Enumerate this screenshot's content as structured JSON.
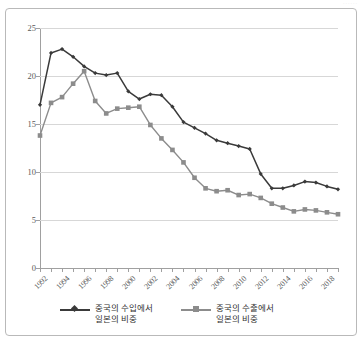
{
  "figure": {
    "scan_artifact_text": "······",
    "background_color": "#ffffff",
    "frame_color": "#b9b9b9"
  },
  "chart_data": {
    "type": "line",
    "title": "",
    "subtitle": "",
    "xlabel": "",
    "ylabel": "",
    "ylim": [
      0,
      25
    ],
    "yticks": [
      0,
      5,
      10,
      15,
      20,
      25
    ],
    "ytick_labels": [
      "0",
      "5",
      "10",
      "15",
      "20",
      "25"
    ],
    "grid": true,
    "grid_axis": "y",
    "legend_position": "bottom",
    "x": [
      1992,
      1993,
      1994,
      1995,
      1996,
      1997,
      1998,
      1999,
      2000,
      2001,
      2002,
      2003,
      2004,
      2005,
      2006,
      2007,
      2008,
      2009,
      2010,
      2011,
      2012,
      2013,
      2014,
      2015,
      2016,
      2017,
      2018,
      2019
    ],
    "xtick_labels": [
      "1992",
      "1994",
      "1996",
      "1998",
      "2000",
      "2002",
      "2004",
      "2006",
      "2008",
      "2010",
      "2012",
      "2014",
      "2016",
      "2018"
    ],
    "xtick_values": [
      1992,
      1994,
      1996,
      1998,
      2000,
      2002,
      2004,
      2006,
      2008,
      2010,
      2012,
      2014,
      2016,
      2018
    ],
    "series": [
      {
        "name": "중국의 수입에서 일본의 비중",
        "name_line1": "중국의 수입에서",
        "name_line2": "일본의 비중",
        "color": "#3a3a3a",
        "marker": "diamond",
        "values": [
          17.0,
          22.4,
          22.8,
          22.0,
          21.0,
          20.3,
          20.1,
          20.3,
          18.4,
          17.6,
          18.1,
          18.0,
          16.8,
          15.2,
          14.6,
          14.0,
          13.3,
          13.0,
          12.7,
          12.4,
          9.8,
          8.3,
          8.3,
          8.6,
          9.0,
          8.9,
          8.5,
          8.2
        ]
      },
      {
        "name": "중국의 수출에서 일본의 비중",
        "name_line1": "중국의 수출에서",
        "name_line2": "일본의 비중",
        "color": "#8c8c8c",
        "marker": "square",
        "values": [
          13.8,
          17.2,
          17.8,
          19.2,
          20.5,
          17.4,
          16.1,
          16.6,
          16.7,
          16.8,
          14.9,
          13.5,
          12.3,
          11.0,
          9.4,
          8.3,
          8.0,
          8.1,
          7.6,
          7.7,
          7.3,
          6.7,
          6.3,
          5.9,
          6.1,
          6.0,
          5.8,
          5.6
        ]
      }
    ]
  }
}
